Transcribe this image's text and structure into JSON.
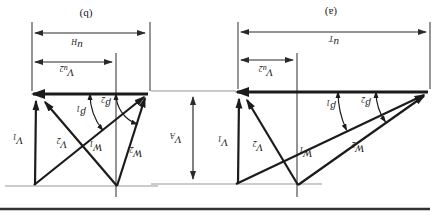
{
  "colors": {
    "paper": "#ffffff",
    "ink": "#1b1b1b",
    "thin_line": "#3f3f3f",
    "reference_line": "#989898",
    "bottom_rule": "#333333"
  },
  "panels": {
    "a": {
      "caption": "(a)",
      "blade_speed_dim": {
        "main": "u",
        "sub": "T"
      },
      "swirl_dim": {
        "main": "V",
        "sub": "u2"
      },
      "v1": {
        "main": "V",
        "sub": "1"
      },
      "v2": {
        "main": "V",
        "sub": "2"
      },
      "w1": {
        "main": "W",
        "sub": "1"
      },
      "w2": {
        "main": "W",
        "sub": "2"
      },
      "beta1": {
        "main": "β",
        "sub": "1"
      },
      "beta2": {
        "main": "β",
        "sub": "2"
      }
    },
    "b": {
      "caption": "(b)",
      "blade_speed_dim": {
        "main": "u",
        "sub": "H"
      },
      "swirl_dim": {
        "main": "V",
        "sub": "u2"
      },
      "v1": {
        "main": "V",
        "sub": "1"
      },
      "v2": {
        "main": "V",
        "sub": "2"
      },
      "w1": {
        "main": "W",
        "sub": "1"
      },
      "w2": {
        "main": "W",
        "sub": "2"
      },
      "beta1": {
        "main": "β",
        "sub": "1"
      },
      "beta2": {
        "main": "β",
        "sub": "2"
      }
    }
  },
  "axial_velocity_dim": {
    "main": "V",
    "sub": "A"
  }
}
